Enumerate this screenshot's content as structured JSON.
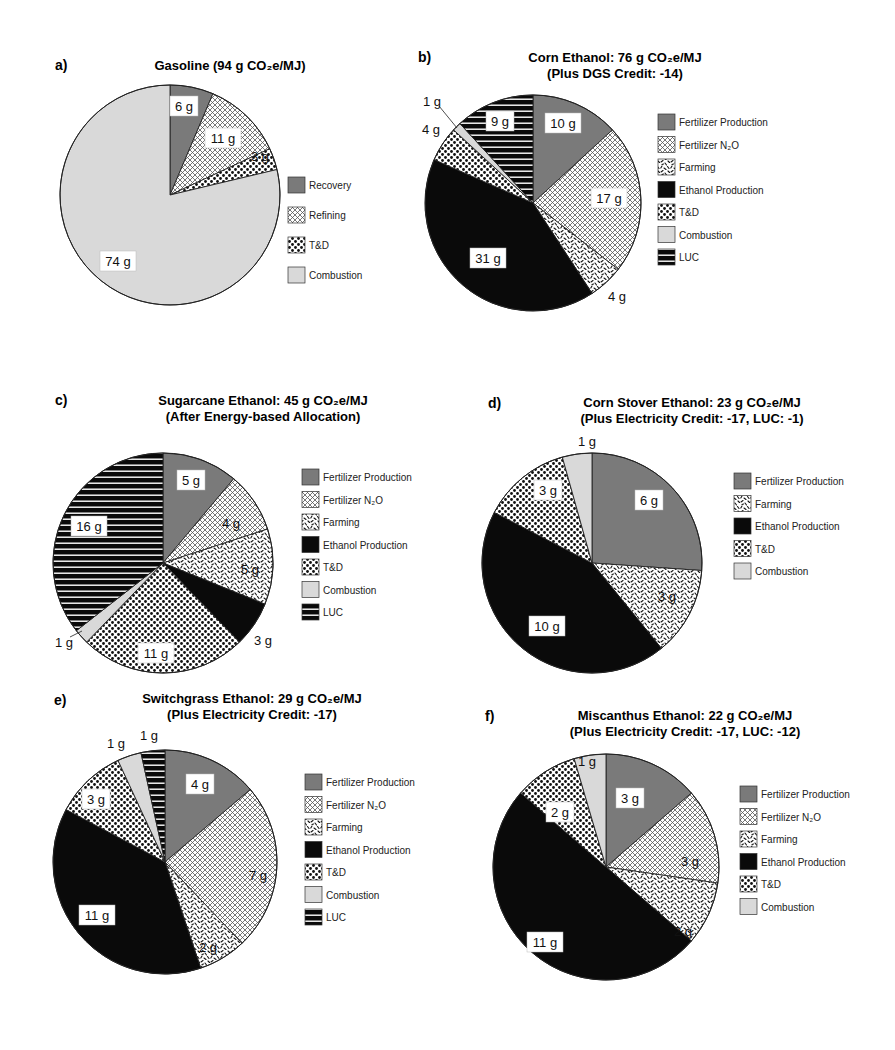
{
  "figure": {
    "panels": [
      {
        "letter": "a)",
        "title_lines": [
          "Gasoline (94 g CO₂e/MJ)"
        ]
      },
      {
        "letter": "b)",
        "title_lines": [
          "Corn Ethanol: 76 g CO₂e/MJ",
          "(Plus DGS Credit: -14)"
        ]
      },
      {
        "letter": "c)",
        "title_lines": [
          "Sugarcane Ethanol: 45 g CO₂e/MJ",
          "(After Energy-based Allocation)"
        ]
      },
      {
        "letter": "d)",
        "title_lines": [
          "Corn Stover Ethanol: 23 g CO₂e/MJ",
          "(Plus Electricity Credit: -17, LUC: -1)"
        ]
      },
      {
        "letter": "e)",
        "title_lines": [
          "Switchgrass Ethanol: 29 g CO₂e/MJ",
          "(Plus Electricity Credit: -17)"
        ]
      },
      {
        "letter": "f)",
        "title_lines": [
          "Miscanthus Ethanol: 22 g CO₂e/MJ",
          "(Plus Electricity Credit: -17, LUC: -12)"
        ]
      }
    ]
  },
  "chart_data": [
    {
      "type": "pie",
      "title": "Gasoline (94 g CO2e/MJ)",
      "categories": [
        "Recovery",
        "Refining",
        "T&D",
        "Combustion"
      ],
      "values": [
        6,
        11,
        3,
        74
      ],
      "labels": [
        "6 g",
        "11 g",
        "3 g",
        "74 g"
      ],
      "unit": "g CO2e/MJ",
      "total": 94,
      "legend_position": "right"
    },
    {
      "type": "pie",
      "title": "Corn Ethanol: 76 g CO2e/MJ",
      "subtitle": "(Plus DGS Credit: -14)",
      "categories": [
        "Fertilizer Production",
        "Fertilizer N2O",
        "Farming",
        "Ethanol Production",
        "T&D",
        "Combustion",
        "LUC"
      ],
      "values": [
        10,
        17,
        4,
        31,
        4,
        1,
        9
      ],
      "labels": [
        "10 g",
        "17 g",
        "4 g",
        "31 g",
        "4 g",
        "1 g",
        "9 g"
      ],
      "unit": "g CO2e/MJ",
      "total": 76,
      "credits": {
        "DGS": -14
      },
      "legend_position": "right"
    },
    {
      "type": "pie",
      "title": "Sugarcane Ethanol: 45 g CO2e/MJ",
      "subtitle": "(After Energy-based Allocation)",
      "categories": [
        "Fertilizer Production",
        "Fertilizer N2O",
        "Farming",
        "Ethanol Production",
        "T&D",
        "Combustion",
        "LUC"
      ],
      "values": [
        5,
        4,
        5,
        3,
        11,
        1,
        16
      ],
      "labels": [
        "5 g",
        "4 g",
        "5 g",
        "3 g",
        "11 g",
        "1 g",
        "16 g"
      ],
      "unit": "g CO2e/MJ",
      "total": 45,
      "legend_position": "right"
    },
    {
      "type": "pie",
      "title": "Corn Stover Ethanol: 23 g CO2e/MJ",
      "subtitle": "(Plus Electricity Credit: -17, LUC: -1)",
      "categories": [
        "Fertilizer Production",
        "Farming",
        "Ethanol Production",
        "T&D",
        "Combustion"
      ],
      "values": [
        6,
        3,
        10,
        3,
        1
      ],
      "labels": [
        "6 g",
        "3 g",
        "10 g",
        "3 g",
        "1 g"
      ],
      "unit": "g CO2e/MJ",
      "total": 23,
      "credits": {
        "Electricity": -17,
        "LUC": -1
      },
      "legend_position": "right"
    },
    {
      "type": "pie",
      "title": "Switchgrass Ethanol: 29 g CO2e/MJ",
      "subtitle": "(Plus Electricity Credit: -17)",
      "categories": [
        "Fertilizer Production",
        "Fertilizer N2O",
        "Farming",
        "Ethanol Production",
        "T&D",
        "Combustion",
        "LUC"
      ],
      "values": [
        4,
        7,
        2,
        11,
        3,
        1,
        1
      ],
      "labels": [
        "4 g",
        "7 g",
        "2 g",
        "11 g",
        "3 g",
        "1 g",
        "1 g"
      ],
      "unit": "g CO2e/MJ",
      "total": 29,
      "credits": {
        "Electricity": -17
      },
      "legend_position": "right"
    },
    {
      "type": "pie",
      "title": "Miscanthus Ethanol: 22 g CO2e/MJ",
      "subtitle": "(Plus Electricity Credit: -17, LUC: -12)",
      "categories": [
        "Fertilizer Production",
        "Fertilizer N2O",
        "Farming",
        "Ethanol Production",
        "T&D",
        "Combustion"
      ],
      "values": [
        3,
        3,
        2,
        11,
        2,
        1
      ],
      "labels": [
        "3 g",
        "3 g",
        "2 g",
        "11 g",
        "2 g",
        "1 g"
      ],
      "unit": "g CO2e/MJ",
      "total": 22,
      "credits": {
        "Electricity": -17,
        "LUC": -12
      },
      "legend_position": "right"
    }
  ],
  "legend_labels": {
    "Recovery": "Recovery",
    "Refining": "Refining",
    "T&D": "T&D",
    "Combustion": "Combustion",
    "Fertilizer Production": "Fertilizer Production",
    "Fertilizer N2O": "Fertilizer N₂O",
    "Farming": "Farming",
    "Ethanol Production": "Ethanol Production",
    "LUC": "LUC"
  },
  "category_fills": {
    "Recovery": "solid-gray",
    "Fertilizer Production": "solid-gray",
    "Refining": "crosshatch",
    "Fertilizer N2O": "crosshatch",
    "Farming": "squiggle",
    "T&D": "dots",
    "Combustion": "light-gray",
    "Ethanol Production": "black",
    "LUC": "h-stripes"
  },
  "colors": {
    "gray": "#7a7a7a",
    "light_gray": "#d9d9d9",
    "black": "#0a0a0a",
    "outline": "#222222"
  }
}
